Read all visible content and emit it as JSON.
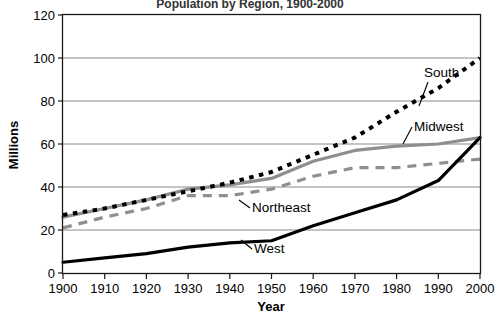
{
  "chart_data": {
    "type": "line",
    "title": "Population by Region, 1900-2000",
    "xlabel": "Year",
    "ylabel": "Millions",
    "x": [
      1900,
      1910,
      1920,
      1930,
      1940,
      1950,
      1960,
      1970,
      1980,
      1990,
      2000
    ],
    "categories": [
      "1900",
      "1910",
      "1920",
      "1930",
      "1940",
      "1950",
      "1960",
      "1970",
      "1980",
      "1990",
      "2000"
    ],
    "xlim": [
      1900,
      2000
    ],
    "ylim": [
      0,
      120
    ],
    "yticks": [
      0,
      20,
      40,
      60,
      80,
      100,
      120
    ],
    "ytick_labels": [
      "0",
      "20",
      "40",
      "60",
      "80",
      "100",
      "120"
    ],
    "grid": "horizontal",
    "legend": "inline-labels",
    "series": [
      {
        "name": "South",
        "values": [
          27,
          30,
          34,
          38,
          42,
          47,
          55,
          63,
          75,
          86,
          100
        ],
        "color": "#000000",
        "style": "dotted"
      },
      {
        "name": "Midwest",
        "values": [
          26,
          30,
          34,
          39,
          41,
          44,
          52,
          57,
          59,
          60,
          63
        ],
        "color": "#8f8f8f",
        "style": "solid"
      },
      {
        "name": "Northeast",
        "values": [
          21,
          26,
          30,
          36,
          36,
          39,
          45,
          49,
          49,
          51,
          53
        ],
        "color": "#8f8f8f",
        "style": "dashed"
      },
      {
        "name": "West",
        "values": [
          5,
          7,
          9,
          12,
          14,
          15,
          22,
          28,
          34,
          43,
          63
        ],
        "color": "#000000",
        "style": "solid"
      }
    ],
    "annotations": [
      {
        "label": "South",
        "series": "South"
      },
      {
        "label": "Midwest",
        "series": "Midwest"
      },
      {
        "label": "Northeast",
        "series": "Northeast"
      },
      {
        "label": "West",
        "series": "West"
      }
    ]
  }
}
